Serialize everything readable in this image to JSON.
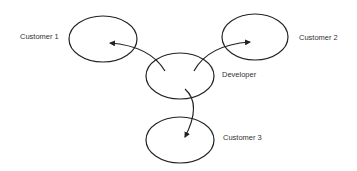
{
  "diagram": {
    "nodes": [
      {
        "id": "customer1",
        "label": "Customer 1",
        "cx": 103,
        "cy": 39,
        "rx": 34,
        "ry": 23,
        "label_x": 20,
        "label_y": 36
      },
      {
        "id": "customer2",
        "label": "Customer 2",
        "cx": 255,
        "cy": 37,
        "rx": 33,
        "ry": 23,
        "label_x": 299,
        "label_y": 37
      },
      {
        "id": "developer",
        "label": "Developer",
        "cx": 180,
        "cy": 76,
        "rx": 34,
        "ry": 23,
        "label_x": 222,
        "label_y": 74
      },
      {
        "id": "customer3",
        "label": "Customer 3",
        "cx": 180,
        "cy": 140,
        "rx": 34,
        "ry": 23,
        "label_x": 223,
        "label_y": 137
      }
    ],
    "edges": [
      {
        "from": "developer",
        "to": "customer1",
        "path": "M 165 71 Q 150 46 110 43"
      },
      {
        "from": "developer",
        "to": "customer2",
        "path": "M 194 71 Q 208 45 250 42"
      },
      {
        "from": "developer",
        "to": "customer3",
        "path": "M 185 89 Q 202 104 185 137"
      }
    ],
    "stroke_color": "#222222"
  }
}
